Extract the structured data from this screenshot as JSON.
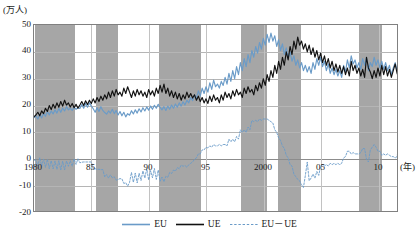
{
  "chart_data": {
    "type": "line",
    "title": "",
    "subtitle": "",
    "xlabel": "(年)",
    "ylabel": "(万人)",
    "ylim": [
      -20,
      50
    ],
    "xlim": [
      1980,
      2011.75
    ],
    "grid": true,
    "legend_position": "bottom",
    "y_ticks": [
      "50",
      "40",
      "30",
      "20",
      "10",
      "0",
      "-10",
      "-20"
    ],
    "y_tick_values": [
      50,
      40,
      30,
      20,
      10,
      0,
      -10,
      -20
    ],
    "x_ticks": [
      "1980",
      "85",
      "90",
      "95",
      "2000",
      "05",
      "10"
    ],
    "x_tick_values": [
      1980,
      1985,
      1990,
      1995,
      2000,
      2005,
      2010
    ],
    "shaded_bands_label": "recession periods",
    "shaded_bands": [
      {
        "start": 1980.1,
        "end": 1983.6
      },
      {
        "start": 1985.4,
        "end": 1987.3
      },
      {
        "start": 1990.9,
        "end": 1994.5
      },
      {
        "start": 1998.0,
        "end": 2000.3
      },
      {
        "start": 2001.2,
        "end": 2003.2
      },
      {
        "start": 2008.3,
        "end": 2010.3
      }
    ],
    "series": [
      {
        "name": "EU",
        "color": "#6a9bc8",
        "style": "solid",
        "values": [
          15.5,
          16.2,
          15.0,
          16.8,
          15.4,
          17.1,
          16.0,
          17.8,
          16.5,
          18.0,
          16.9,
          18.4,
          17.2,
          18.9,
          17.5,
          19.1,
          18.0,
          19.6,
          18.4,
          19.0,
          18.2,
          19.4,
          18.6,
          19.2,
          18.9,
          20.4,
          19.0,
          20.8,
          19.4,
          21.0,
          19.8,
          18.8,
          17.5,
          19.2,
          17.8,
          19.6,
          18.2,
          17.4,
          16.8,
          18.0,
          17.2,
          18.6,
          17.0,
          18.2,
          16.5,
          17.8,
          16.2,
          17.5,
          15.8,
          17.0,
          16.4,
          18.1,
          16.9,
          18.4,
          17.2,
          18.8,
          17.6,
          19.2,
          18.0,
          19.5,
          18.3,
          19.8,
          18.6,
          20.1,
          19.0,
          20.5,
          19.3,
          18.4,
          19.6,
          18.2,
          19.8,
          18.6,
          20.2,
          19.0,
          20.6,
          19.4,
          21.0,
          19.8,
          21.4,
          20.2,
          22.0,
          21.0,
          23.0,
          21.8,
          24.0,
          22.5,
          25.5,
          23.5,
          26.5,
          24.5,
          27.0,
          25.0,
          28.5,
          26.0,
          29.5,
          27.0,
          28.0,
          26.5,
          29.0,
          27.5,
          30.5,
          28.0,
          32.0,
          29.0,
          33.0,
          30.0,
          34.5,
          31.5,
          36.0,
          33.0,
          37.5,
          34.5,
          39.0,
          36.0,
          40.5,
          38.0,
          42.0,
          39.5,
          43.5,
          41.0,
          45.0,
          42.5,
          46.5,
          43.5,
          47.0,
          44.0,
          46.0,
          42.0,
          44.5,
          40.5,
          43.0,
          39.0,
          41.5,
          37.5,
          40.0,
          36.5,
          38.5,
          35.0,
          37.0,
          34.0,
          36.0,
          33.0,
          35.0,
          32.5,
          34.5,
          32.0,
          36.0,
          33.5,
          37.5,
          35.0,
          38.0,
          34.5,
          36.5,
          33.0,
          35.5,
          32.0,
          34.0,
          31.5,
          33.5,
          31.0,
          33.0,
          30.5,
          35.0,
          32.5,
          37.0,
          34.0,
          38.5,
          35.5,
          37.0,
          34.0,
          36.0,
          33.5,
          37.5,
          35.0,
          38.0,
          33.0,
          36.0,
          34.5,
          38.0,
          35.0,
          37.0,
          34.0,
          36.5,
          33.5,
          36.0,
          33.0,
          35.0,
          31.5,
          34.0,
          36.0,
          33.0,
          35.5
        ]
      },
      {
        "name": "UE",
        "color": "#111111",
        "style": "solid",
        "values": [
          15.8,
          16.5,
          17.5,
          16.2,
          18.0,
          17.0,
          19.0,
          17.8,
          20.0,
          18.5,
          20.5,
          19.0,
          21.0,
          19.4,
          21.5,
          19.8,
          22.0,
          20.2,
          21.0,
          19.5,
          20.8,
          19.2,
          20.5,
          19.0,
          20.2,
          21.5,
          20.0,
          21.8,
          20.4,
          22.0,
          20.8,
          22.5,
          21.0,
          23.0,
          21.5,
          23.5,
          22.0,
          24.0,
          22.5,
          25.0,
          23.0,
          25.5,
          23.5,
          26.0,
          24.0,
          25.0,
          23.5,
          26.5,
          24.5,
          27.0,
          25.0,
          23.0,
          25.5,
          23.5,
          26.0,
          24.0,
          25.5,
          23.5,
          25.0,
          23.0,
          26.0,
          24.0,
          25.5,
          23.5,
          26.5,
          24.5,
          27.5,
          25.0,
          28.0,
          24.5,
          26.5,
          23.5,
          25.5,
          23.0,
          25.0,
          22.5,
          24.5,
          22.0,
          24.0,
          22.5,
          25.0,
          23.0,
          24.5,
          22.8,
          24.0,
          22.0,
          23.5,
          21.5,
          23.0,
          21.0,
          22.5,
          20.8,
          23.5,
          21.5,
          24.0,
          22.0,
          23.0,
          21.0,
          24.0,
          22.0,
          25.0,
          23.0,
          24.5,
          22.5,
          25.5,
          23.5,
          26.0,
          24.0,
          25.0,
          23.0,
          26.5,
          24.5,
          27.0,
          25.0,
          26.0,
          24.0,
          27.5,
          25.5,
          28.5,
          26.5,
          30.0,
          27.5,
          31.5,
          29.0,
          33.0,
          30.5,
          35.0,
          32.0,
          36.5,
          33.5,
          38.0,
          35.0,
          40.0,
          37.0,
          42.0,
          39.0,
          44.0,
          41.0,
          45.5,
          42.5,
          44.0,
          41.0,
          43.0,
          40.0,
          42.5,
          39.0,
          41.5,
          38.0,
          40.5,
          37.0,
          39.5,
          36.0,
          38.5,
          35.0,
          37.5,
          34.0,
          36.5,
          33.0,
          35.5,
          32.5,
          35.0,
          32.0,
          34.5,
          31.5,
          34.0,
          31.0,
          36.5,
          33.0,
          35.0,
          32.0,
          34.0,
          31.0,
          33.5,
          30.5,
          38.0,
          34.0,
          32.5,
          30.0,
          33.0,
          30.5,
          34.0,
          31.0,
          35.0,
          31.5,
          34.5,
          31.0,
          33.5,
          30.5,
          33.0,
          35.5,
          32.0,
          30.0
        ]
      },
      {
        "name": "EU－UE",
        "color": "#6a9bc8",
        "style": "dashed",
        "values": [
          -0.3,
          -0.3,
          -2.5,
          0.6,
          -2.6,
          0.1,
          -3.0,
          0.0,
          -3.5,
          -0.5,
          -3.6,
          -0.6,
          -3.8,
          -0.5,
          -4.0,
          -0.7,
          -4.0,
          -0.6,
          -2.6,
          -0.5,
          -2.6,
          0.2,
          -1.9,
          0.2,
          -1.3,
          -1.1,
          -1.0,
          -1.0,
          -1.0,
          -1.0,
          -1.0,
          -3.7,
          -3.5,
          -3.8,
          -3.7,
          -3.9,
          -3.8,
          -6.6,
          -5.7,
          -7.0,
          -5.8,
          -6.9,
          -6.5,
          -7.8,
          -7.5,
          -7.2,
          -7.3,
          -9.0,
          -8.7,
          -10.0,
          -8.6,
          -4.9,
          -8.6,
          -5.1,
          -8.8,
          -5.2,
          -7.9,
          -4.3,
          -7.0,
          -3.5,
          -7.7,
          -4.2,
          -6.9,
          -3.4,
          -7.5,
          -4.0,
          -8.2,
          -6.6,
          -8.4,
          -6.3,
          -6.7,
          -4.9,
          -5.3,
          -4.0,
          -4.4,
          -3.1,
          -3.5,
          -2.2,
          -2.6,
          -2.3,
          -3.0,
          -2.0,
          -1.5,
          -1.0,
          0.0,
          0.5,
          2.0,
          2.0,
          3.5,
          3.5,
          4.5,
          4.2,
          5.0,
          4.5,
          5.5,
          5.0,
          5.0,
          5.5,
          5.0,
          5.5,
          5.5,
          5.0,
          7.5,
          6.5,
          7.5,
          6.5,
          8.5,
          7.5,
          11.0,
          10.0,
          11.0,
          10.0,
          12.0,
          11.0,
          14.5,
          14.0,
          14.5,
          14.0,
          15.0,
          14.5,
          15.0,
          15.0,
          15.0,
          14.5,
          14.0,
          13.5,
          11.0,
          10.0,
          8.0,
          7.0,
          5.0,
          4.0,
          1.5,
          0.5,
          -2.0,
          -2.5,
          -5.5,
          -6.5,
          -7.5,
          -8.0,
          -9.5,
          -10.5,
          -6.0,
          -1.0,
          -8.0,
          -7.0,
          -5.5,
          -7.0,
          -4.5,
          -6.0,
          -2.5,
          -2.0,
          -2.5,
          -2.0,
          -2.5,
          -1.5,
          -2.0,
          -1.5,
          -2.0,
          -1.5,
          -2.0,
          -1.5,
          0.5,
          1.0,
          3.0,
          3.0,
          2.0,
          2.5,
          2.0,
          2.0,
          2.0,
          2.5,
          4.0,
          4.0,
          0.0,
          -1.0,
          3.5,
          4.5,
          5.5,
          4.5,
          3.0,
          3.0,
          1.5,
          2.0,
          1.5,
          2.0,
          1.5,
          1.0,
          1.0,
          0.5,
          1.0,
          5.5
        ]
      }
    ]
  },
  "legend": {
    "items": [
      {
        "label": "EU",
        "color": "#6a9bc8",
        "style": "solid"
      },
      {
        "label": "UE",
        "color": "#111111",
        "style": "solid"
      },
      {
        "label": "EU－UE",
        "color": "#6a9bc8",
        "style": "dashed"
      }
    ]
  }
}
